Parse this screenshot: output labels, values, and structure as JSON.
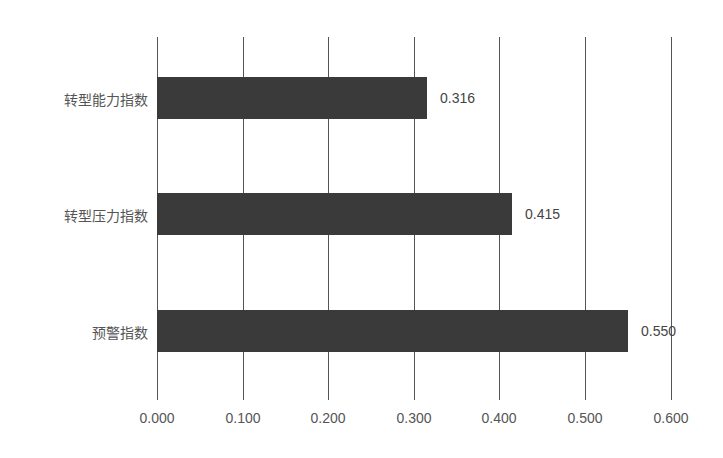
{
  "chart_data": {
    "type": "bar",
    "orientation": "horizontal",
    "title": "",
    "xlabel": "",
    "ylabel": "",
    "categories": [
      "转型能力指数",
      "转型压力指数",
      "预警指数"
    ],
    "values": [
      0.316,
      0.415,
      0.55
    ],
    "value_labels": [
      "0.316",
      "0.415",
      "0.550"
    ],
    "xlim": [
      0,
      0.6
    ],
    "x_ticks": [
      "0.000",
      "0.100",
      "0.200",
      "0.300",
      "0.400",
      "0.500",
      "0.600"
    ],
    "grid": "vertical",
    "legend": "none",
    "bar_color": "#3a3a3a"
  }
}
